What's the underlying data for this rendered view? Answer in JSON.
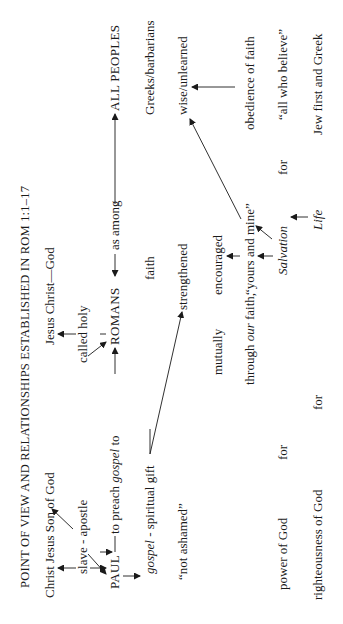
{
  "title": "POINT OF VIEW AND RELATIONSHIPS ESTABLISHED IN ROM 1:1–17",
  "nodes": {
    "christ_jesus_son": "Christ Jesus Son of God",
    "jesus_christ_god": "Jesus Christ—God",
    "slave_apostle": "slave - apostle",
    "called_holy": "called holy",
    "paul": "PAUL",
    "to_preach_prefix": "to preach ",
    "to_preach_gospel": "gospel",
    "to_preach_suffix": " to",
    "romans": "ROMANS",
    "as_among": "as among",
    "all_peoples": "ALL PEOPLES",
    "gospel_word": "gospel",
    "spiritual_gift": " - spiritual gift",
    "faith": "faith",
    "greeks_barbarians": "Greeks/barbarians",
    "not_ashamed": "“not ashamed”",
    "strengthened": "strengthened",
    "wise_unlearned": "wise/unlearned",
    "mutually": "mutually",
    "encouraged": "encouraged",
    "through_prefix": "through ",
    "through_our": "our",
    "through_suffix": " faith,",
    "yours_and_mine": "“yours and mine”",
    "obedience_of_faith": "obedience of faith",
    "power_of_god": "power of God",
    "for_1": "for",
    "salvation": "Salvation",
    "for_2": "for",
    "all_who_believe": "“all who believe”",
    "righteousness_of_god": "righteousness of God",
    "for_3": "for",
    "life": "Life",
    "jew_first_and_greek": "Jew first and Greek"
  },
  "orientation": "rotated 90° counter-clockwise"
}
